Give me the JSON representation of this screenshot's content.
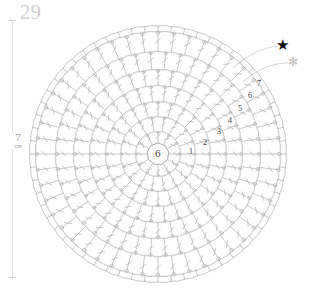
{
  "page": {
    "number": "29",
    "background_color": "#ffffff",
    "line_color": "#b0b0b0"
  },
  "scale": {
    "value": "7",
    "unit": "cm",
    "orientation": "vertical",
    "tick_color": "#dedede"
  },
  "legend": {
    "star_symbol": "★",
    "star_color": "#111111",
    "asterisk_symbol": "✻",
    "asterisk_color": "#b9b9b9"
  },
  "chart_data": {
    "type": "diagram",
    "subtype": "crochet-round-chart",
    "title": "",
    "center_label": "6",
    "center_note": "magic ring with 6 chain stitches",
    "round_count": 7,
    "rounds": [
      {
        "label": "1",
        "index": 1,
        "x": 189,
        "y": 148,
        "stitches": 12
      },
      {
        "label": "2",
        "index": 2,
        "x": 203,
        "y": 139,
        "stitches": 18
      },
      {
        "label": "3",
        "index": 3,
        "x": 217,
        "y": 128,
        "stitches": 24
      },
      {
        "label": "4",
        "index": 4,
        "x": 228,
        "y": 117,
        "stitches": 30
      },
      {
        "label": "5",
        "index": 5,
        "x": 238,
        "y": 105,
        "stitches": 36
      },
      {
        "label": "6",
        "index": 6,
        "x": 248,
        "y": 92,
        "stitches": 42
      },
      {
        "label": "7",
        "index": 7,
        "x": 257,
        "y": 80,
        "stitches": 48
      }
    ],
    "geometry": {
      "center_x": 158,
      "center_y": 154,
      "outer_radius": 128,
      "ring_radius": 11,
      "spokes": 48
    },
    "ring_radii": [
      22,
      37,
      52,
      68,
      84,
      102,
      122
    ],
    "stitch_symbol": "double-crochet",
    "xlabel": "",
    "ylabel": ""
  }
}
